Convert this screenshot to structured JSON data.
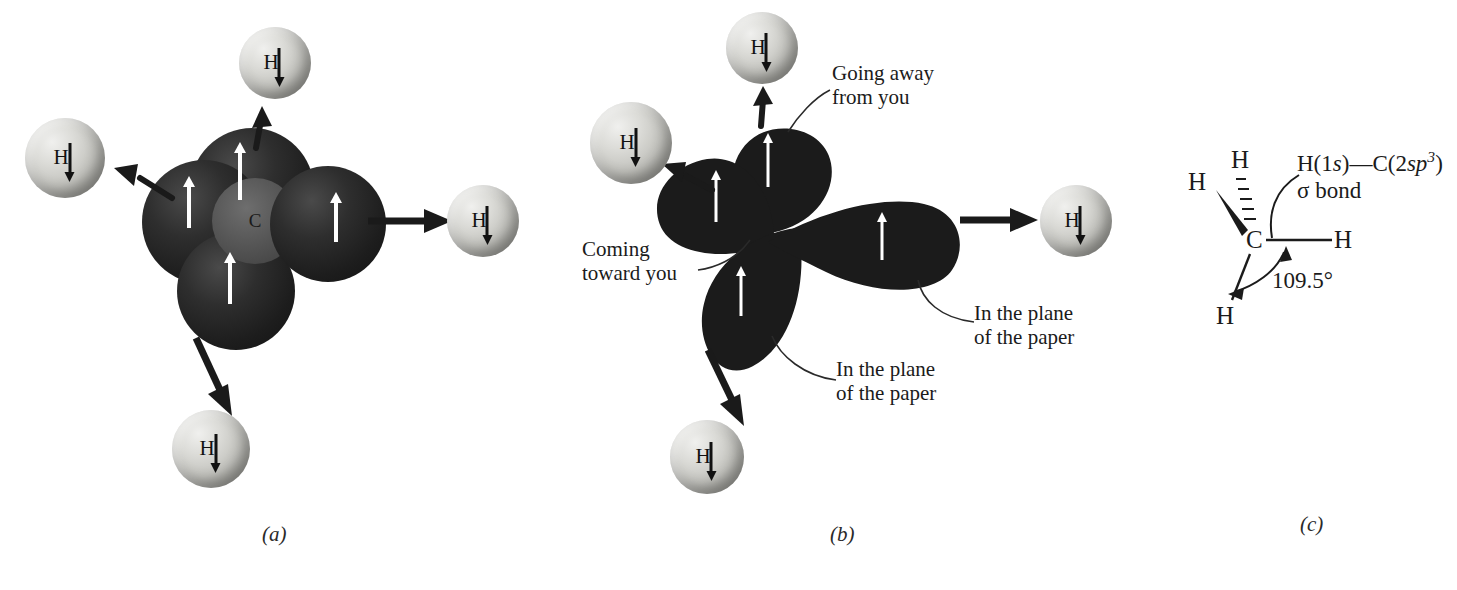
{
  "figure": {
    "panels": [
      {
        "id": "a",
        "caption": "(a)",
        "center_atom_label": "C",
        "hydrogen_label": "H",
        "hydrogen_count": 4,
        "orbital_electron_spin": "up",
        "hydrogen_electron_spin": "down"
      },
      {
        "id": "b",
        "caption": "(b)",
        "hydrogen_label": "H",
        "hydrogen_count": 4,
        "annotations": [
          "Going away from you",
          "Coming toward you",
          "In the plane of the paper",
          "In the plane of the paper"
        ]
      },
      {
        "id": "c",
        "caption": "(c)",
        "atoms": [
          "H",
          "H",
          "H",
          "H",
          "C"
        ],
        "bond_label_line1": "H(1s)—C(2sp3)",
        "bond_label_line2": "σ bond",
        "angle_label": "109.5°"
      }
    ]
  },
  "panel_a": {
    "caption": "(a)",
    "carbon_label": "C",
    "hydrogens": [
      {
        "id": "top",
        "label": "H",
        "spin": "down"
      },
      {
        "id": "left",
        "label": "H",
        "spin": "down"
      },
      {
        "id": "right",
        "label": "H",
        "spin": "down"
      },
      {
        "id": "bottom",
        "label": "H",
        "spin": "down"
      }
    ]
  },
  "panel_b": {
    "caption": "(b)",
    "hydrogens": [
      {
        "id": "top",
        "label": "H",
        "spin": "down"
      },
      {
        "id": "left",
        "label": "H",
        "spin": "down"
      },
      {
        "id": "right",
        "label": "H",
        "spin": "down"
      },
      {
        "id": "bottom",
        "label": "H",
        "spin": "down"
      }
    ],
    "labels": {
      "going_away_line1": "Going away",
      "going_away_line2": "from you",
      "coming_toward_line1": "Coming",
      "coming_toward_line2": "toward you",
      "in_plane_right_line1": "In the plane",
      "in_plane_right_line2": "of the paper",
      "in_plane_bottom_line1": "In the plane",
      "in_plane_bottom_line2": "of the paper"
    }
  },
  "panel_c": {
    "caption": "(c)",
    "carbon_label": "C",
    "h_wedge": "H",
    "h_dashed": "H",
    "h_right": "H",
    "h_bottom": "H",
    "bond_label": {
      "h_part": "H(1",
      "h_orbital": "s",
      "h_close": ")",
      "dash": "—",
      "c_part": "C(2",
      "c_orbital": "sp",
      "c_exponent": "3",
      "c_close": ")",
      "sigma_line": "σ bond"
    },
    "angle_label": "109.5°"
  },
  "colors": {
    "background": "#ffffff",
    "orbital_dark": "#1d1d1d",
    "carbon_core": "#555555",
    "hydrogen_sphere": "#c2c2bd",
    "spin_arrow": "#111111",
    "orbital_arrow": "#ffffff",
    "text": "#1b1b1b"
  }
}
